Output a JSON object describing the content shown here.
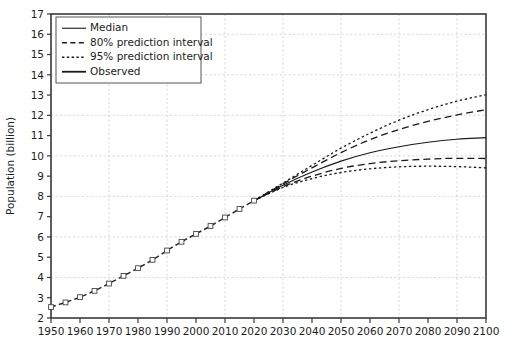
{
  "chart_data": {
    "type": "line",
    "title": "",
    "xlabel": "",
    "ylabel": "Population (billion)",
    "xlim": [
      1950,
      2100
    ],
    "ylim": [
      2,
      17
    ],
    "ytick_labels": [
      "17",
      "16",
      "15",
      "14",
      "13",
      "12",
      "11",
      "10",
      "9",
      "8",
      "7",
      "6",
      "5",
      "4",
      "3",
      "2"
    ],
    "yticks": [
      17,
      16,
      15,
      14,
      13,
      12,
      11,
      10,
      9,
      8,
      7,
      6,
      5,
      4,
      3,
      2
    ],
    "xtick_labels": [
      "1950",
      "1960",
      "1970",
      "1980",
      "1990",
      "2000",
      "2010",
      "2020",
      "2030",
      "2040",
      "2050",
      "2060",
      "2070",
      "2080",
      "2090",
      "2100"
    ],
    "xticks": [
      1950,
      1960,
      1970,
      1980,
      1990,
      2000,
      2010,
      2020,
      2030,
      2040,
      2050,
      2060,
      2070,
      2080,
      2090,
      2100
    ],
    "grid": true,
    "grid_x_values": [
      1950,
      1970,
      1990,
      2010,
      2030,
      2050,
      2070,
      2090
    ],
    "grid_y_values": [
      4,
      6,
      8,
      10,
      12,
      14,
      16
    ],
    "legend_position": "upper-left",
    "legend": [
      {
        "label": "Median",
        "style": "solid"
      },
      {
        "label": "80% prediction interval",
        "style": "dashed"
      },
      {
        "label": "95% prediction interval",
        "style": "dotted"
      },
      {
        "label": "Observed",
        "style": "solid-thick-marker"
      }
    ],
    "series": [
      {
        "name": "Observed",
        "style": "solid-thick-marker",
        "x": [
          1950,
          1955,
          1960,
          1965,
          1970,
          1975,
          1980,
          1985,
          1990,
          1995,
          2000,
          2005,
          2010,
          2015,
          2020
        ],
        "values": [
          2.54,
          2.77,
          3.03,
          3.34,
          3.7,
          4.08,
          4.46,
          4.87,
          5.33,
          5.76,
          6.15,
          6.54,
          6.96,
          7.38,
          7.79
        ]
      },
      {
        "name": "Median",
        "style": "solid",
        "x": [
          2020,
          2030,
          2040,
          2050,
          2060,
          2070,
          2080,
          2090,
          2100
        ],
        "values": [
          7.79,
          8.55,
          9.2,
          9.74,
          10.15,
          10.45,
          10.67,
          10.82,
          10.9
        ]
      },
      {
        "name": "80% prediction interval upper",
        "style": "dashed",
        "x": [
          2020,
          2030,
          2040,
          2050,
          2060,
          2070,
          2080,
          2090,
          2100
        ],
        "values": [
          7.79,
          8.62,
          9.41,
          10.16,
          10.8,
          11.3,
          11.7,
          12.02,
          12.28
        ]
      },
      {
        "name": "80% prediction interval lower",
        "style": "dashed",
        "x": [
          2020,
          2030,
          2040,
          2050,
          2060,
          2070,
          2080,
          2090,
          2100
        ],
        "values": [
          7.79,
          8.48,
          9.0,
          9.38,
          9.62,
          9.76,
          9.84,
          9.88,
          9.87
        ]
      },
      {
        "name": "95% prediction interval upper",
        "style": "dotted",
        "x": [
          2020,
          2030,
          2040,
          2050,
          2060,
          2070,
          2080,
          2090,
          2100
        ],
        "values": [
          7.79,
          8.66,
          9.53,
          10.38,
          11.12,
          11.76,
          12.28,
          12.7,
          13.02
        ]
      },
      {
        "name": "95% prediction interval lower",
        "style": "dotted",
        "x": [
          2020,
          2030,
          2040,
          2050,
          2060,
          2070,
          2080,
          2090,
          2100
        ],
        "values": [
          7.79,
          8.44,
          8.88,
          9.18,
          9.36,
          9.46,
          9.49,
          9.47,
          9.41
        ]
      }
    ]
  }
}
